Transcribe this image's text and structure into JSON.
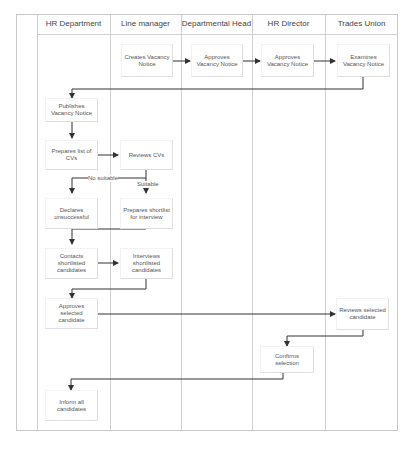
{
  "diagram": {
    "type": "swimlane-flowchart",
    "lanes": [
      {
        "id": "hr",
        "label": "HR Department"
      },
      {
        "id": "lm",
        "label": "Line manager"
      },
      {
        "id": "dh",
        "label": "Departmental Head"
      },
      {
        "id": "hrd",
        "label": "HR Director"
      },
      {
        "id": "tu",
        "label": "Trades Union"
      }
    ],
    "nodes": {
      "create_notice": "Creates Vacancy Notice",
      "dh_approve": "Approves Vacancy Notice",
      "hrd_approve": "Approves Vacancy Notice",
      "tu_examine": "Examines Vacancy Notice",
      "publish": "Publishes Vacancy Notice",
      "prep_list": "Prepares list of CVs",
      "review_cvs": "Reviews CVs",
      "declare": "Declares unsuccessful",
      "prep_shortlist": "Prepares shortlist for interview",
      "contact": "Contacts shortlisted candidates",
      "interview": "Interviews shortlisted candidates",
      "approve_selected": "Approves selected candidate",
      "tu_review": "Reviews selected candidate",
      "confirm": "Confirms selection",
      "inform": "Inform all candidates"
    },
    "edge_labels": {
      "no_suitable": "No suitable",
      "suitable": "Suitable"
    },
    "edges": [
      [
        "create_notice",
        "dh_approve"
      ],
      [
        "dh_approve",
        "hrd_approve"
      ],
      [
        "hrd_approve",
        "tu_examine"
      ],
      [
        "tu_examine",
        "publish"
      ],
      [
        "publish",
        "prep_list"
      ],
      [
        "prep_list",
        "review_cvs"
      ],
      [
        "review_cvs",
        "declare",
        "No suitable"
      ],
      [
        "review_cvs",
        "prep_shortlist",
        "Suitable"
      ],
      [
        "prep_shortlist",
        "contact"
      ],
      [
        "contact",
        "interview"
      ],
      [
        "interview",
        "approve_selected"
      ],
      [
        "approve_selected",
        "tu_review"
      ],
      [
        "tu_review",
        "confirm"
      ],
      [
        "confirm",
        "inform"
      ]
    ],
    "colors": {
      "line": "#333333",
      "lane_border": "#cfcfcf",
      "box_border": "#dedede",
      "text": "#555555"
    }
  }
}
